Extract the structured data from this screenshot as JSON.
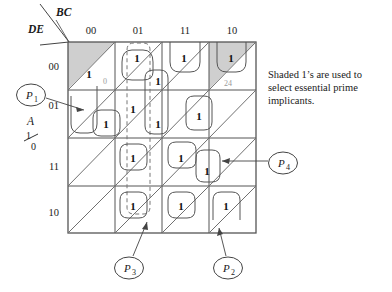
{
  "figure": {
    "type": "karnaugh-map",
    "variables": {
      "column_var_label": "BC",
      "row_var_label": "DE",
      "cell_split_var_label": "A",
      "cell_split_values_top": "1",
      "cell_split_values_bottom": "0"
    },
    "column_headers": [
      "00",
      "01",
      "11",
      "10"
    ],
    "row_headers": [
      "00",
      "01",
      "11",
      "10"
    ],
    "cell_minterm_labels": [
      {
        "text": "0",
        "col": 0,
        "row": 0,
        "half": "lower"
      },
      {
        "text": "24",
        "col": 3,
        "row": 0,
        "half": "lower"
      }
    ],
    "ones": [
      {
        "col": 0,
        "row": 0,
        "half": "upper",
        "shaded": true
      },
      {
        "col": 1,
        "row": 0,
        "half": "upper",
        "shaded": false
      },
      {
        "col": 1,
        "row": 0,
        "half": "lower",
        "shaded": false
      },
      {
        "col": 2,
        "row": 0,
        "half": "upper",
        "shaded": false
      },
      {
        "col": 3,
        "row": 0,
        "half": "upper",
        "shaded": true
      },
      {
        "col": 0,
        "row": 1,
        "half": "lower",
        "shaded": false
      },
      {
        "col": 1,
        "row": 1,
        "half": "upper",
        "shaded": false
      },
      {
        "col": 1,
        "row": 1,
        "half": "lower",
        "shaded": false
      },
      {
        "col": 2,
        "row": 1,
        "half": "lower",
        "shaded": false
      },
      {
        "col": 1,
        "row": 2,
        "half": "upper",
        "shaded": false
      },
      {
        "col": 2,
        "row": 2,
        "half": "upper",
        "shaded": false
      },
      {
        "col": 2,
        "row": 2,
        "half": "lower",
        "shaded": false
      },
      {
        "col": 1,
        "row": 3,
        "half": "upper",
        "shaded": false
      },
      {
        "col": 2,
        "row": 3,
        "half": "upper",
        "shaded": false
      },
      {
        "col": 3,
        "row": 3,
        "half": "upper",
        "shaded": false
      }
    ],
    "prime_implicant_callouts": [
      {
        "label": "P",
        "subscript": "1"
      },
      {
        "label": "P",
        "subscript": "2"
      },
      {
        "label": "P",
        "subscript": "3"
      },
      {
        "label": "P",
        "subscript": "4"
      }
    ],
    "caption": {
      "line1": "Shaded 1’s are used to",
      "line2": "select essential prime",
      "line3": "implicants."
    }
  },
  "colors": {
    "ink": "#1a1a1a",
    "grid": "#555555",
    "diagonal": "#707070",
    "shade_fill": "#cfcfcf",
    "group_solid": "#555555",
    "group_dashed": "#777777",
    "minterm_gray": "#9a9a9a"
  }
}
